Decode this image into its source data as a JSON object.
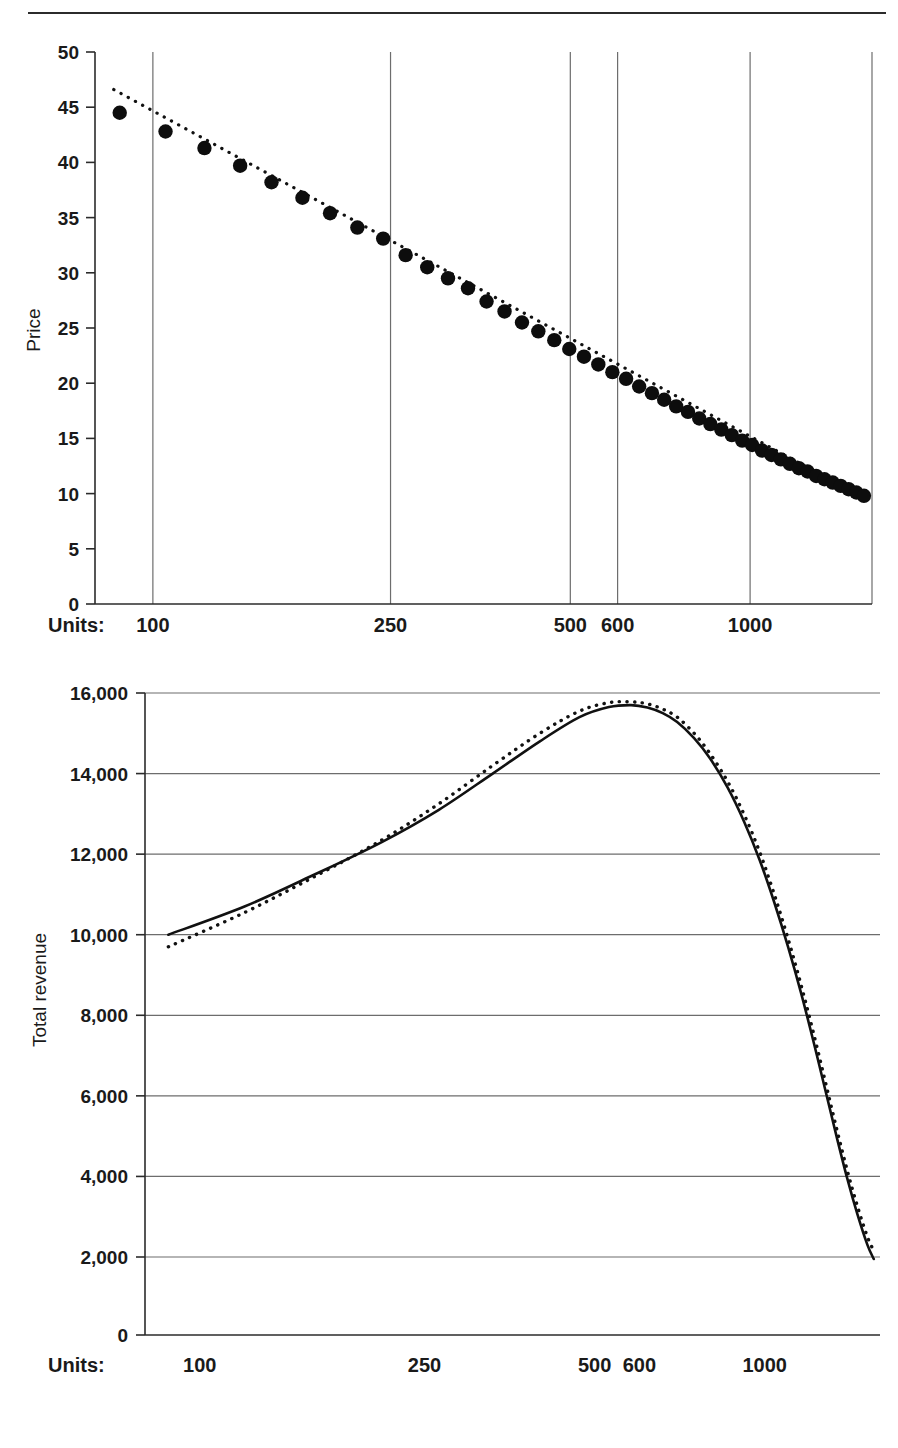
{
  "page": {
    "divider": "horizontal-rule"
  },
  "chart_data": [
    {
      "id": "price-chart",
      "type": "scatter",
      "title": "",
      "xlabel": "Units:",
      "ylabel": "Price",
      "x_scale": "log",
      "x_tick_labels": [
        "100",
        "250",
        "500",
        "600",
        "1000"
      ],
      "x_tick_values": [
        100,
        250,
        500,
        600,
        1000
      ],
      "xlim": [
        80,
        1600
      ],
      "ylim": [
        0,
        50
      ],
      "y_tick_labels": [
        "0",
        "5",
        "10",
        "15",
        "20",
        "25",
        "30",
        "35",
        "40",
        "45",
        "50"
      ],
      "y_tick_values": [
        0,
        5,
        10,
        15,
        20,
        25,
        30,
        35,
        40,
        45,
        50
      ],
      "grid": "vertical-only",
      "legend": "none",
      "series": [
        {
          "name": "Observed price",
          "style": "filled-circle-markers",
          "x": [
            88,
            105,
            122,
            140,
            158,
            178,
            198,
            220,
            243,
            265,
            288,
            312,
            337,
            362,
            388,
            415,
            442,
            470,
            498,
            527,
            557,
            588,
            620,
            652,
            685,
            718,
            752,
            787,
            822,
            858,
            895,
            932,
            970,
            1008,
            1047,
            1086,
            1126,
            1166,
            1207,
            1248,
            1290,
            1332,
            1375,
            1418,
            1462,
            1506,
            1551
          ],
          "y": [
            44.5,
            42.8,
            41.3,
            39.7,
            38.2,
            36.8,
            35.4,
            34.1,
            33.1,
            31.6,
            30.5,
            29.5,
            28.6,
            27.4,
            26.5,
            25.5,
            24.7,
            23.9,
            23.1,
            22.4,
            21.7,
            21.0,
            20.4,
            19.7,
            19.1,
            18.5,
            17.9,
            17.4,
            16.8,
            16.3,
            15.8,
            15.3,
            14.8,
            14.4,
            13.9,
            13.5,
            13.1,
            12.7,
            12.3,
            12.0,
            11.6,
            11.3,
            11.0,
            10.7,
            10.4,
            10.1,
            9.8
          ]
        },
        {
          "name": "Fitted trend",
          "style": "fine-dotted-line",
          "x": [
            86,
            1560
          ],
          "y": [
            46.6,
            9.5
          ]
        }
      ]
    },
    {
      "id": "total-revenue-chart",
      "type": "line",
      "title": "",
      "xlabel": "Units:",
      "ylabel": "Total revenue",
      "x_scale": "log",
      "x_tick_labels": [
        "100",
        "250",
        "500",
        "600",
        "1000"
      ],
      "x_tick_values": [
        100,
        250,
        500,
        600,
        1000
      ],
      "xlim": [
        80,
        1600
      ],
      "ylim": [
        0,
        16000
      ],
      "y_axis_break": true,
      "y_tick_labels": [
        "0",
        "2,000",
        "4,000",
        "6,000",
        "8,000",
        "10,000",
        "12,000",
        "14,000",
        "16,000"
      ],
      "y_tick_values": [
        0,
        2000,
        4000,
        6000,
        8000,
        10000,
        12000,
        14000,
        16000
      ],
      "grid": "horizontal-only",
      "legend": "none",
      "series": [
        {
          "name": "Modelled revenue",
          "style": "solid-line",
          "x": [
            88,
            120,
            160,
            210,
            265,
            330,
            400,
            470,
            530,
            580,
            620,
            660,
            700,
            750,
            800,
            860,
            920,
            980,
            1040,
            1100,
            1160,
            1220,
            1280,
            1340,
            1400,
            1460,
            1520,
            1560
          ],
          "y": [
            10000,
            10700,
            11500,
            12300,
            13100,
            14000,
            14800,
            15400,
            15650,
            15700,
            15640,
            15500,
            15280,
            14880,
            14380,
            13650,
            12800,
            11850,
            10800,
            9700,
            8550,
            7350,
            6150,
            5000,
            3950,
            3050,
            2300,
            1950
          ]
        },
        {
          "name": "Observed revenue",
          "style": "dotted-line",
          "x": [
            88,
            120,
            160,
            210,
            265,
            330,
            400,
            470,
            530,
            580,
            620,
            660,
            700,
            750,
            800,
            860,
            920,
            980,
            1040,
            1100,
            1160,
            1220,
            1280,
            1340,
            1400,
            1460,
            1520,
            1560
          ],
          "y": [
            9700,
            10550,
            11450,
            12350,
            13250,
            14200,
            15000,
            15550,
            15760,
            15780,
            15730,
            15600,
            15400,
            15000,
            14500,
            13800,
            12980,
            12050,
            11000,
            9900,
            8750,
            7560,
            6360,
            5200,
            4150,
            3250,
            2500,
            2150
          ]
        }
      ]
    }
  ]
}
